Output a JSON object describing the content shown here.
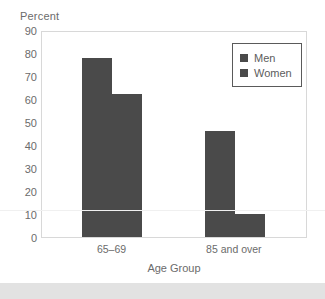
{
  "chart_data": {
    "type": "bar",
    "title": "",
    "xlabel": "Age Group",
    "ylabel": "Percent",
    "categories": [
      "65–69",
      "85 and over"
    ],
    "series": [
      {
        "name": "Men",
        "values": [
          78,
          46
        ]
      },
      {
        "name": "Women",
        "values": [
          62,
          10
        ]
      }
    ],
    "ylim": [
      0,
      90
    ],
    "yticks": [
      90,
      80,
      70,
      60,
      50,
      40,
      30,
      20,
      10,
      0
    ],
    "ytick_labels": [
      "90",
      "80",
      "70",
      "60",
      "50",
      "40",
      "30",
      "20",
      "10",
      "0"
    ],
    "grid": false,
    "legend_position": "top-right",
    "bar_color": "#4a4a4a",
    "text_color": "#6b6b6b",
    "frame_color": "#d8d8d8"
  },
  "axes": {
    "y_title": "Percent",
    "x_title": "Age Group"
  },
  "legend": {
    "items": [
      {
        "label": "Men",
        "color": "#4a4a4a"
      },
      {
        "label": "Women",
        "color": "#4a4a4a"
      }
    ]
  },
  "yticks": [
    {
      "label": "90"
    },
    {
      "label": "80"
    },
    {
      "label": "70"
    },
    {
      "label": "60"
    },
    {
      "label": "50"
    },
    {
      "label": "40"
    },
    {
      "label": "30"
    },
    {
      "label": "20"
    },
    {
      "label": "10"
    },
    {
      "label": "0"
    }
  ],
  "xticks": [
    {
      "label": "65–69"
    },
    {
      "label": "85 and over"
    }
  ]
}
